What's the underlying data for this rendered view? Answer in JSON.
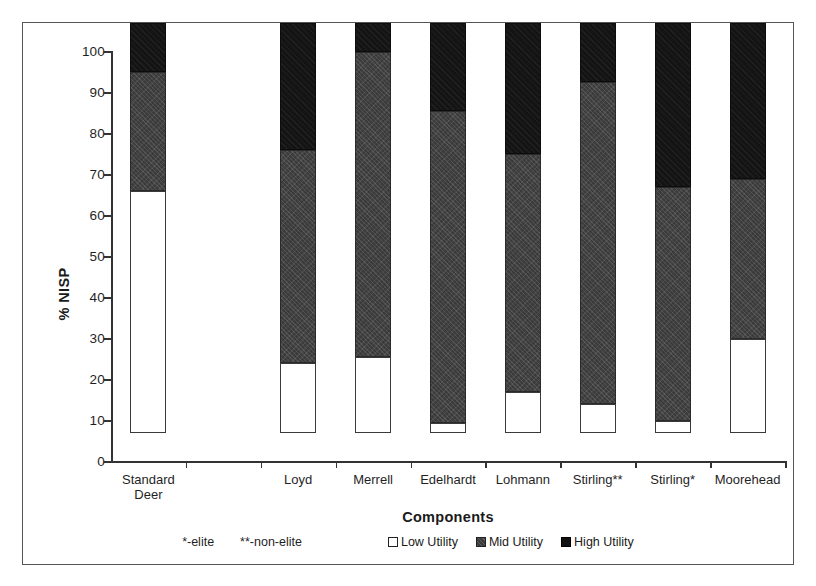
{
  "chart_data": {
    "type": "bar",
    "subtype": "stacked-bar-100-percent",
    "title": "",
    "xlabel": "Components",
    "ylabel": "% NISP",
    "ylim": [
      0,
      100
    ],
    "ytick_step": 10,
    "yticks": [
      "100",
      "90",
      "80",
      "70",
      "60",
      "50",
      "40",
      "30",
      "20",
      "10",
      "0"
    ],
    "grid": false,
    "legend_position": "bottom-center",
    "categories": [
      "Standard\nDeer",
      "",
      "Loyd",
      "Merrell",
      "Edelhardt",
      "Lohmann",
      "Stirling**",
      "Stirling*",
      "Moorehead"
    ],
    "series": [
      {
        "name": "Low Utility",
        "color": "#ffffff",
        "values": [
          59,
          null,
          17,
          18.5,
          2.5,
          10,
          7,
          3,
          23
        ]
      },
      {
        "name": "Mid Utility",
        "color": "#3b3b3b",
        "values": [
          29,
          null,
          52,
          74.5,
          76,
          58,
          78.5,
          57,
          39
        ]
      },
      {
        "name": "High Utility",
        "color": "#141414",
        "values": [
          12,
          null,
          31,
          7,
          21.5,
          32,
          14.5,
          40,
          38
        ]
      }
    ],
    "cumulative_tops": {
      "Standard Deer": {
        "low": 59,
        "mid": 88,
        "high": 100
      },
      "Loyd": {
        "low": 17,
        "mid": 69,
        "high": 100
      },
      "Merrell": {
        "low": 18.5,
        "mid": 93,
        "high": 100
      },
      "Edelhardt": {
        "low": 2.5,
        "mid": 78.5,
        "high": 100
      },
      "Lohmann": {
        "low": 10,
        "mid": 68,
        "high": 100
      },
      "Stirling**": {
        "low": 7,
        "mid": 85.5,
        "high": 100
      },
      "Stirling*": {
        "low": 3,
        "mid": 60,
        "high": 100
      },
      "Moorehead": {
        "low": 23,
        "mid": 62,
        "high": 100
      }
    },
    "annotations": [
      "*-elite",
      "**-non-elite"
    ]
  },
  "axes": {
    "y_title": "% NISP",
    "x_title": "Components"
  },
  "legend": {
    "note_elite": "*-elite",
    "note_non_elite": "**-non-elite",
    "entries": [
      {
        "label": "Low Utility",
        "swatch": "low"
      },
      {
        "label": "Mid Utility",
        "swatch": "mid"
      },
      {
        "label": "High Utility",
        "swatch": "high"
      }
    ]
  },
  "ticks": {
    "y": [
      "100",
      "90",
      "80",
      "70",
      "60",
      "50",
      "40",
      "30",
      "20",
      "10",
      "0"
    ]
  },
  "x_labels": [
    "Standard\nDeer",
    "",
    "Loyd",
    "Merrell",
    "Edelhardt",
    "Lohmann",
    "Stirling**",
    "Stirling*",
    "Moorehead"
  ]
}
